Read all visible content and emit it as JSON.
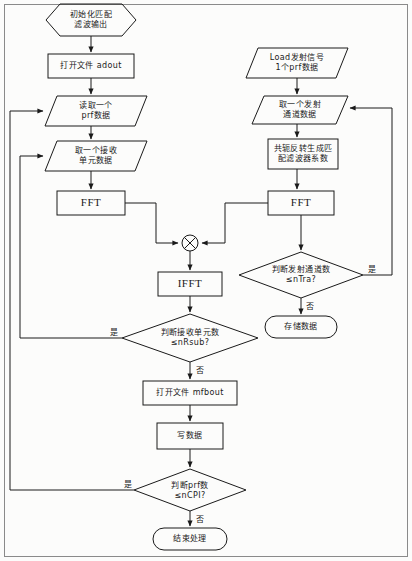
{
  "diagram": {
    "frame": {
      "border_color": "#8a8a8a"
    },
    "stroke_color": "#1a1a1a",
    "background": "#fcfcfb"
  },
  "nodes": {
    "start": {
      "shape": "hexagon",
      "line1": "初始化匹配",
      "line2": "滤波输出"
    },
    "open_adout": {
      "shape": "process",
      "line1": "打开文件 adout"
    },
    "read_prf": {
      "shape": "io-parallelogram",
      "line1": "读取一个",
      "line2": "prf数据"
    },
    "read_rx_unit": {
      "shape": "io-parallelogram",
      "line1": "取一个接收",
      "line2": "单元数据"
    },
    "fft_left": {
      "shape": "process",
      "line1": "FFT"
    },
    "load_tx": {
      "shape": "io-parallelogram",
      "line1": "Load发射信号",
      "line2": "1个prf数据"
    },
    "read_tx_chan": {
      "shape": "io-parallelogram",
      "line1": "取一个发射",
      "line2": "通道数据"
    },
    "conj_reverse": {
      "shape": "process",
      "line1": "共轭反转生成匹",
      "line2": "配滤波器系数"
    },
    "fft_right": {
      "shape": "process",
      "line1": "FFT"
    },
    "multiply": {
      "shape": "circle-cross",
      "symbol": "×"
    },
    "ifft": {
      "shape": "process",
      "line1": "IFFT"
    },
    "decide_tx_chan": {
      "shape": "decision",
      "line1": "判断发射通道数",
      "line2": "≤nTra?"
    },
    "store_data": {
      "shape": "terminal-rounded",
      "line1": "存储数据"
    },
    "decide_rx_unit": {
      "shape": "decision",
      "line1": "判断接收单元数",
      "line2": "≤nRsub?"
    },
    "open_mfbout": {
      "shape": "process",
      "line1": "打开文件 mfbout"
    },
    "write_data": {
      "shape": "process",
      "line1": "写数据"
    },
    "decide_prf": {
      "shape": "decision",
      "line1": "判断prf数",
      "line2": "≤nCPI?"
    },
    "end": {
      "shape": "terminal-rounded",
      "line1": "结束处理"
    }
  },
  "edge_labels": {
    "rx_unit_yes": "是",
    "rx_unit_no": "否",
    "tx_chan_yes": "是",
    "tx_chan_no": "否",
    "prf_yes": "是",
    "prf_no": "否"
  }
}
